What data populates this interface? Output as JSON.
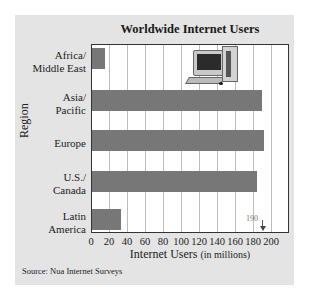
{
  "chart_data": {
    "type": "bar",
    "orientation": "horizontal",
    "title": "Worldwide Internet Users",
    "xlabel": "Internet Users",
    "xlabel_unit": "(in millions)",
    "ylabel": "Region",
    "categories": [
      "Africa/ Middle East",
      "Asia/ Pacific",
      "Europe",
      "U.S./ Canada",
      "Latin America"
    ],
    "category_lines": [
      [
        "Africa/",
        "Middle East"
      ],
      [
        "Asia/",
        "Pacific"
      ],
      [
        "Europe"
      ],
      [
        "U.S./",
        "Canada"
      ],
      [
        "Latin",
        "America"
      ]
    ],
    "values": [
      14,
      189,
      191,
      183,
      32
    ],
    "xlim": [
      0,
      220
    ],
    "xticks": [
      0,
      20,
      40,
      60,
      80,
      100,
      120,
      140,
      160,
      180,
      200
    ],
    "grid": "vertical",
    "legend": null,
    "annotations": [
      {
        "text": "190",
        "x": 190,
        "type": "arrow-marker"
      }
    ],
    "bar_color": "#777777"
  },
  "source": "Source: Nua Internet Surveys",
  "decoration": "computer-clipart"
}
